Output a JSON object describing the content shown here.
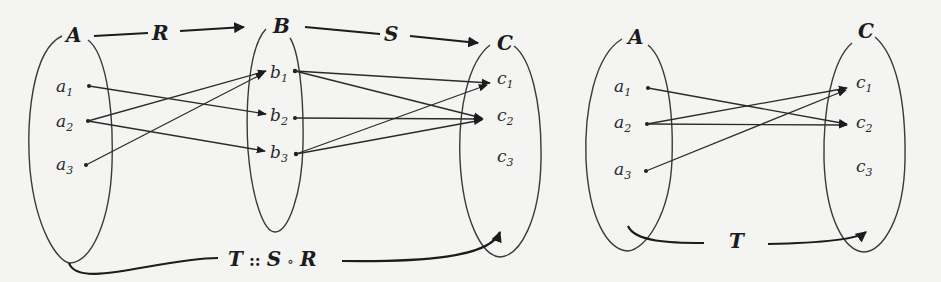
{
  "diagram": {
    "left": {
      "sets": {
        "A": {
          "label": "A",
          "elements": [
            "a",
            "a",
            "a"
          ],
          "subs": [
            "1",
            "2",
            "3"
          ]
        },
        "B": {
          "label": "B",
          "elements": [
            "b",
            "b",
            "b"
          ],
          "subs": [
            "1",
            "2",
            "3"
          ]
        },
        "C": {
          "label": "C",
          "elements": [
            "c",
            "c",
            "c"
          ],
          "subs": [
            "1",
            "2",
            "3"
          ]
        }
      },
      "relations": {
        "R": {
          "label": "R",
          "from": "A",
          "to": "B",
          "pairs": [
            [
              "a1",
              "b2"
            ],
            [
              "a2",
              "b1"
            ],
            [
              "a2",
              "b3"
            ],
            [
              "a3",
              "b1"
            ]
          ]
        },
        "S": {
          "label": "S",
          "from": "B",
          "to": "C",
          "pairs": [
            [
              "b1",
              "c1"
            ],
            [
              "b1",
              "c2"
            ],
            [
              "b2",
              "c2"
            ],
            [
              "b3",
              "c1"
            ],
            [
              "b3",
              "c2"
            ]
          ]
        }
      },
      "composition": {
        "label_T": "T",
        "label_sep": "::",
        "label_S": "S",
        "label_op": "∘",
        "label_R": "R"
      }
    },
    "right": {
      "sets": {
        "A": {
          "label": "A",
          "elements": [
            "a",
            "a",
            "a"
          ],
          "subs": [
            "1",
            "2",
            "3"
          ]
        },
        "C": {
          "label": "C",
          "elements": [
            "c",
            "c",
            "c"
          ],
          "subs": [
            "1",
            "2",
            "3"
          ]
        }
      },
      "relations": {
        "T": {
          "label": "T",
          "from": "A",
          "to": "C",
          "pairs": [
            [
              "a1",
              "c2"
            ],
            [
              "a2",
              "c1"
            ],
            [
              "a2",
              "c2"
            ],
            [
              "a3",
              "c1"
            ]
          ]
        }
      }
    }
  }
}
